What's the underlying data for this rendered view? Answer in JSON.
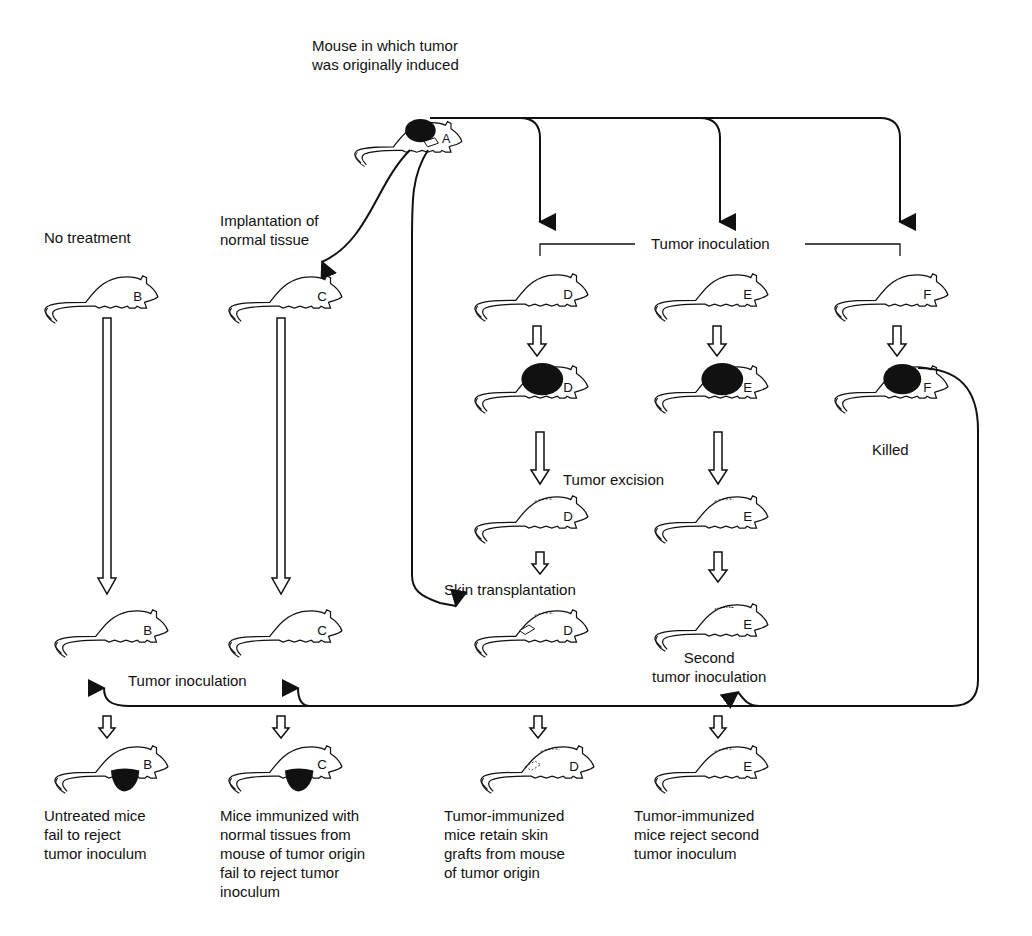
{
  "diagram": {
    "title": "Mouse in which tumor\nwas originally induced",
    "labels": {
      "no_treatment": "No treatment",
      "implantation": "Implantation of\nnormal tissue",
      "tumor_inoculation_top": "Tumor inoculation",
      "tumor_excision": "Tumor excision",
      "killed": "Killed",
      "skin_transplantation": "Skin transplantation",
      "second_inoculation": "Second\ntumor inoculation",
      "tumor_inoculation_bottom": "Tumor inoculation"
    },
    "mice": {
      "A": "A",
      "B": "B",
      "C": "C",
      "D": "D",
      "E": "E",
      "F": "F"
    },
    "captions": {
      "B": "Untreated mice\nfail to reject\ntumor inoculum",
      "C": "Mice immunized with\nnormal tissues from\nmouse of tumor origin\nfail to reject tumor\ninoculum",
      "D": "Tumor-immunized\nmice retain skin\ngrafts from mouse\nof tumor origin",
      "E": "Tumor-immunized\nmice reject second\ntumor inoculum"
    },
    "colors": {
      "ink": "#111111",
      "background": "#ffffff"
    }
  }
}
